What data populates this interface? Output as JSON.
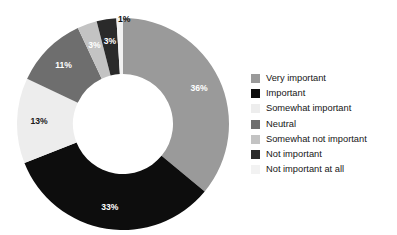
{
  "chart_data": {
    "type": "pie",
    "variant": "donut",
    "title": "",
    "subtitle": "",
    "xlabel": "",
    "ylabel": "",
    "grid": false,
    "legend_position": "right",
    "start_angle_deg": 0,
    "direction": "clockwise",
    "units": "percent",
    "total": 100,
    "categories": [
      "Very important",
      "Important",
      "Somewhat important",
      "Neutral",
      "Somewhat not important",
      "Not important",
      "Not important at all"
    ],
    "values": [
      36,
      33,
      13,
      11,
      3,
      3,
      1
    ],
    "data_labels": [
      "36%",
      "33%",
      "13%",
      "11%",
      "3%",
      "3%",
      "1%"
    ],
    "colors": [
      "#9a9a9a",
      "#0d0d0d",
      "#ededed",
      "#6e6e6e",
      "#c3c3c3",
      "#2a2a2a",
      "#f2f2f2"
    ],
    "label_text_colors": [
      "#ffffff",
      "#ffffff",
      "#1a1a1a",
      "#ffffff",
      "#ffffff",
      "#ffffff",
      "#131313"
    ],
    "slices": [
      {
        "label": "Very important",
        "value": 36,
        "data_label": "36%",
        "color": "#9a9a9a",
        "label_tone": "on-dark",
        "label_outside": false
      },
      {
        "label": "Important",
        "value": 33,
        "data_label": "33%",
        "color": "#0d0d0d",
        "label_tone": "on-dark",
        "label_outside": false
      },
      {
        "label": "Somewhat important",
        "value": 13,
        "data_label": "13%",
        "color": "#ededed",
        "label_tone": "on-light",
        "label_outside": false
      },
      {
        "label": "Neutral",
        "value": 11,
        "data_label": "11%",
        "color": "#6e6e6e",
        "label_tone": "on-dark",
        "label_outside": false
      },
      {
        "label": "Somewhat not important",
        "value": 3,
        "data_label": "3%",
        "color": "#c3c3c3",
        "label_tone": "on-dark",
        "label_outside": false
      },
      {
        "label": "Not important",
        "value": 3,
        "data_label": "3%",
        "color": "#2a2a2a",
        "label_tone": "on-dark",
        "label_outside": false
      },
      {
        "label": "Not important at all",
        "value": 1,
        "data_label": "1%",
        "color": "#f2f2f2",
        "label_tone": "on-light",
        "label_outside": true
      }
    ]
  },
  "legend": {
    "items": [
      {
        "label": "Very important",
        "color": "#9a9a9a"
      },
      {
        "label": "Important",
        "color": "#0d0d0d"
      },
      {
        "label": "Somewhat important",
        "color": "#ededed"
      },
      {
        "label": "Neutral",
        "color": "#6e6e6e"
      },
      {
        "label": "Somewhat not important",
        "color": "#c3c3c3"
      },
      {
        "label": "Not important",
        "color": "#2a2a2a"
      },
      {
        "label": "Not important at all",
        "color": "#f2f2f2"
      }
    ]
  },
  "outside_labels": [
    {
      "text": "1%",
      "left": 118,
      "top": 14
    }
  ]
}
